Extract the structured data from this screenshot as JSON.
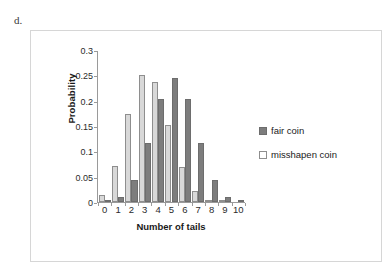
{
  "figure": {
    "label": "d."
  },
  "legend": {
    "position": "right",
    "items": [
      {
        "label": "fair coin",
        "swatch": "fair",
        "color": "#7d7d7d"
      },
      {
        "label": "misshapen coin",
        "swatch": "misshapen",
        "color": "#d8d8d8"
      }
    ]
  },
  "chart_data": {
    "type": "bar",
    "title": "",
    "xlabel": "Number of tails",
    "ylabel": "Probability",
    "categories": [
      "0",
      "1",
      "2",
      "3",
      "4",
      "5",
      "6",
      "7",
      "8",
      "9",
      "10"
    ],
    "x": [
      0,
      1,
      2,
      3,
      4,
      5,
      6,
      7,
      8,
      9,
      10
    ],
    "series": [
      {
        "name": "fair coin",
        "color": "#7d7d7d",
        "values": [
          0.001,
          0.01,
          0.044,
          0.117,
          0.205,
          0.246,
          0.205,
          0.117,
          0.044,
          0.01,
          0.001
        ]
      },
      {
        "name": "misshapen coin",
        "color": "#d8d8d8",
        "values": [
          0.0135,
          0.0725,
          0.1757,
          0.2522,
          0.2377,
          0.1536,
          0.0689,
          0.0212,
          0.0043,
          0.0005,
          0.0
        ]
      }
    ],
    "ylim": [
      0,
      0.3
    ],
    "ytick_labels": [
      "0",
      "0.05",
      "0.1",
      "0.15",
      "0.2",
      "0.25",
      "0.3"
    ],
    "yticks": [
      0,
      0.05,
      0.1,
      0.15,
      0.2,
      0.25,
      0.3
    ],
    "grid": false,
    "legend_position": "right"
  }
}
